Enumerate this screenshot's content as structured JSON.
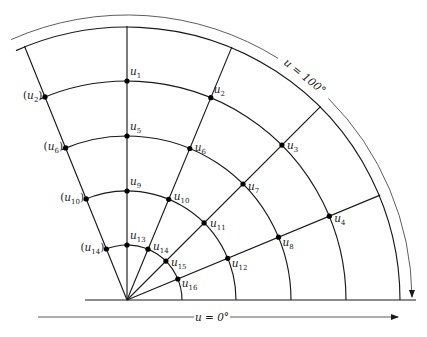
{
  "diagram": {
    "type": "polar-grid-finite-difference",
    "center": [
      127,
      300
    ],
    "radii": [
      55,
      109,
      164,
      219,
      273
    ],
    "outer_radius": 274,
    "rays_deg": [
      0,
      22.5,
      45,
      67.5,
      90,
      112
    ],
    "arc_start_deg": 114,
    "baseline": {
      "x1": 85,
      "x2": 416,
      "y": 300
    },
    "nodes": [
      {
        "id": "u1",
        "label": "u",
        "sub": "1",
        "r": 219,
        "deg": 90,
        "dx": 3,
        "dy": -6,
        "paren": false
      },
      {
        "id": "u2",
        "label": "u",
        "sub": "2",
        "r": 219,
        "deg": 67.5,
        "dx": 3,
        "dy": -5,
        "paren": false
      },
      {
        "id": "u3",
        "label": "u",
        "sub": "3",
        "r": 219,
        "deg": 45,
        "dx": 5,
        "dy": 4,
        "paren": false
      },
      {
        "id": "u4",
        "label": "u",
        "sub": "4",
        "r": 219,
        "deg": 22.5,
        "dx": 5,
        "dy": 6,
        "paren": false
      },
      {
        "id": "u5",
        "label": "u",
        "sub": "5",
        "r": 164,
        "deg": 90,
        "dx": 3,
        "dy": -6,
        "paren": false
      },
      {
        "id": "u6",
        "label": "u",
        "sub": "6",
        "r": 164,
        "deg": 67.5,
        "dx": 5,
        "dy": 2,
        "paren": false
      },
      {
        "id": "u7",
        "label": "u",
        "sub": "7",
        "r": 164,
        "deg": 45,
        "dx": 5,
        "dy": 6,
        "paren": false
      },
      {
        "id": "u8",
        "label": "u",
        "sub": "8",
        "r": 164,
        "deg": 22.5,
        "dx": 4,
        "dy": 9,
        "paren": false
      },
      {
        "id": "u9",
        "label": "u",
        "sub": "9",
        "r": 109,
        "deg": 90,
        "dx": 3,
        "dy": -6,
        "paren": false
      },
      {
        "id": "u10",
        "label": "u",
        "sub": "10",
        "r": 109,
        "deg": 67.5,
        "dx": 5,
        "dy": 1,
        "paren": false
      },
      {
        "id": "u11",
        "label": "u",
        "sub": "11",
        "r": 109,
        "deg": 45,
        "dx": 6,
        "dy": 4,
        "paren": false
      },
      {
        "id": "u12",
        "label": "u",
        "sub": "12",
        "r": 109,
        "deg": 22.5,
        "dx": 4,
        "dy": 9,
        "paren": false
      },
      {
        "id": "u13",
        "label": "u",
        "sub": "13",
        "r": 55,
        "deg": 90,
        "dx": 3,
        "dy": -6,
        "paren": false
      },
      {
        "id": "u14",
        "label": "u",
        "sub": "14",
        "r": 55,
        "deg": 67.5,
        "dx": 5,
        "dy": 1,
        "paren": false
      },
      {
        "id": "u15",
        "label": "u",
        "sub": "15",
        "r": 55,
        "deg": 45,
        "dx": 5,
        "dy": 5,
        "paren": false
      },
      {
        "id": "u16",
        "label": "u",
        "sub": "16",
        "r": 55,
        "deg": 22.5,
        "dx": 4,
        "dy": 8,
        "paren": false
      },
      {
        "id": "u2i",
        "label": "u",
        "sub": "2",
        "r": 219,
        "deg": 112,
        "dx": -22,
        "dy": 2,
        "paren": true
      },
      {
        "id": "u6i",
        "label": "u",
        "sub": "6",
        "r": 164,
        "deg": 112,
        "dx": -22,
        "dy": 2,
        "paren": true
      },
      {
        "id": "u10i",
        "label": "u",
        "sub": "10",
        "r": 109,
        "deg": 112,
        "dx": -26,
        "dy": 2,
        "paren": true
      },
      {
        "id": "u14i",
        "label": "u",
        "sub": "14",
        "r": 55,
        "deg": 112,
        "dx": -26,
        "dy": 2,
        "paren": true
      }
    ],
    "annotations": {
      "outer": {
        "text": "u = 100°",
        "radius": 285,
        "deg_start": 114,
        "deg_end": 0
      },
      "bottom": {
        "text": "u = 0°",
        "y": 317,
        "x1": 38,
        "x2": 398
      }
    },
    "colors": {
      "ink": "#1a1a1a",
      "background": "#ffffff"
    }
  }
}
